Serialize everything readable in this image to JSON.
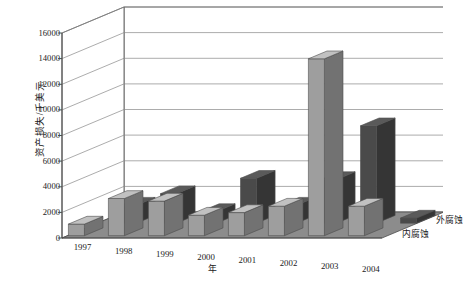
{
  "chart_data": {
    "type": "bar",
    "title": "",
    "subtitle": "",
    "xlabel": "年",
    "ylabel": "资产损失/千美元",
    "zlabel": "",
    "categories": [
      "1997",
      "1998",
      "1999",
      "2000",
      "2001",
      "2002",
      "2003",
      "2004"
    ],
    "ylim": [
      0,
      16000
    ],
    "ytick_values": [
      0,
      2000,
      4000,
      6000,
      8000,
      10000,
      12000,
      14000,
      16000
    ],
    "ytick_labels": [
      "0",
      "2000",
      "4000",
      "6000",
      "8000",
      "10000",
      "12000",
      "14000",
      "16000"
    ],
    "grid": true,
    "legend_position": "right-depth-axis",
    "projection": "3d",
    "series": [
      {
        "name": "外腐蚀",
        "row": "back",
        "color": "#4a4a4a",
        "values": [
          1400,
          2300,
          900,
          3500,
          1400,
          3400,
          7600,
          400
        ]
      },
      {
        "name": "内腐蚀",
        "row": "front",
        "color": "#9e9e9e",
        "values": [
          900,
          2900,
          2700,
          1600,
          1800,
          2300,
          13800,
          2300
        ]
      }
    ]
  },
  "axis": {
    "y_label": "资产损失/千美元",
    "x_label": "年"
  },
  "depth_labels": [
    {
      "name": "外腐蚀"
    },
    {
      "name": "内腐蚀"
    }
  ],
  "caption": {
    "text": ""
  },
  "colors": {
    "back_series": "#4a4a4a",
    "front_series": "#9e9e9e",
    "floor": "#8c8c8c",
    "wall": "#ffffff",
    "grid": "#888888",
    "outline": "#4d4d4d"
  }
}
